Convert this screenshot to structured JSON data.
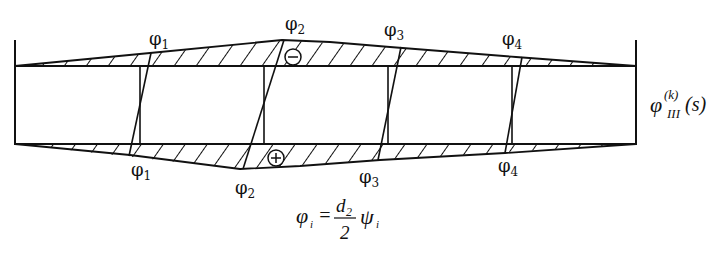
{
  "diagram": {
    "type": "shear-angle distribution along stiffened beam",
    "top_labels": [
      {
        "text": "φ",
        "sub": "1"
      },
      {
        "text": "φ",
        "sub": "2"
      },
      {
        "text": "φ",
        "sub": "3"
      },
      {
        "text": "φ",
        "sub": "4"
      }
    ],
    "bottom_labels": [
      {
        "text": "φ",
        "sub": "1"
      },
      {
        "text": "φ",
        "sub": "2"
      },
      {
        "text": "φ",
        "sub": "3"
      },
      {
        "text": "φ",
        "sub": "4"
      }
    ],
    "signs": {
      "top": "−",
      "bottom": "+"
    },
    "side_label": {
      "base": "φ",
      "superscript": "(k)",
      "subscript": "III",
      "arg": "(s)"
    },
    "formula": {
      "lhs": "φ",
      "lhs_sub": "i",
      "eq": "=",
      "num": "d",
      "num_sub": "2",
      "den": "2",
      "rhs": "ψ",
      "rhs_sub": "i"
    },
    "colors": {
      "line": "#111111",
      "background": "#ffffff"
    }
  }
}
